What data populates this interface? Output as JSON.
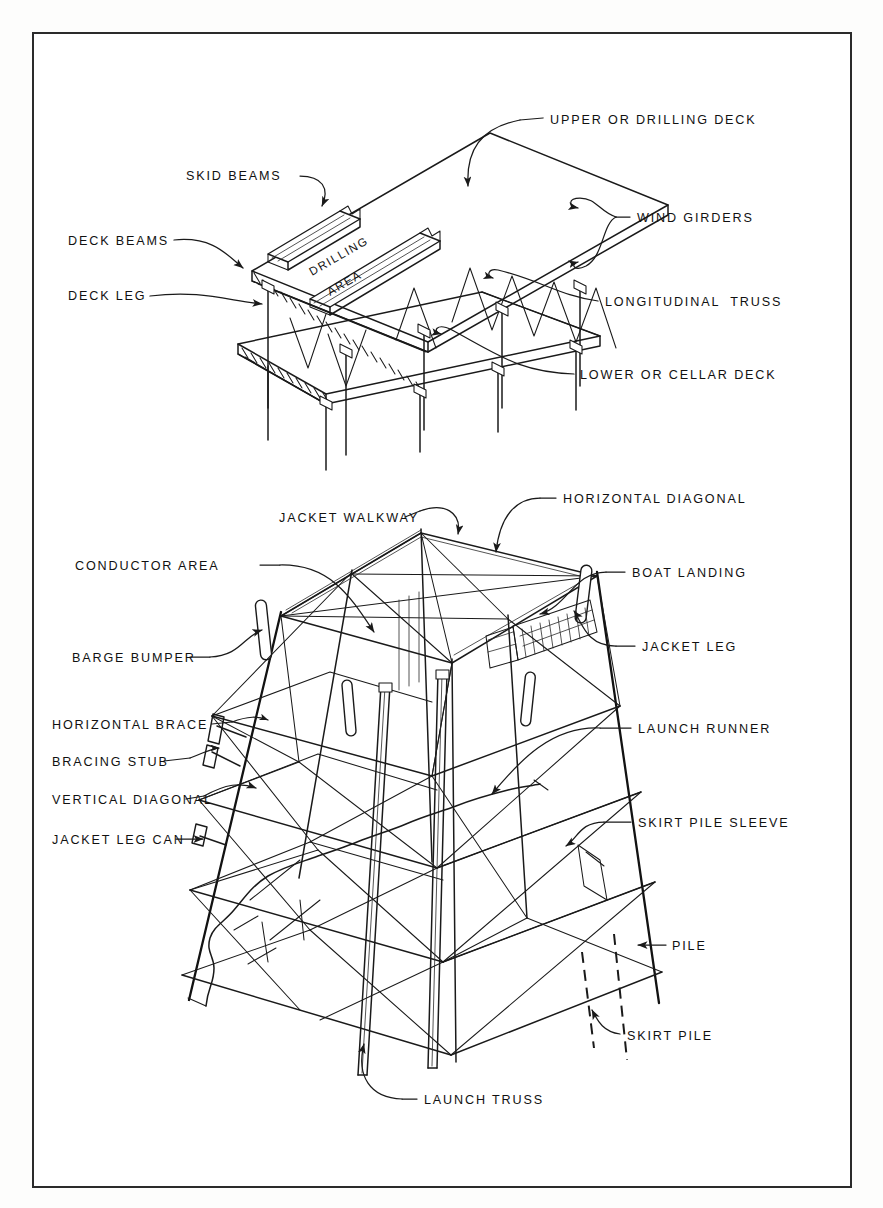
{
  "figure": {
    "domain": "engineering-diagram",
    "line_color": "#1a1a1a",
    "background_color": "#ffffff",
    "frame_color": "#2b2b2b"
  },
  "upper_diagram": {
    "name": "deck-structure",
    "inline_text": {
      "drilling_area_line1": "DRILLING",
      "drilling_area_line2": "AREA"
    },
    "labels": [
      {
        "id": "skid-beams",
        "text": "SKID BEAMS",
        "x": 186,
        "y": 180,
        "anchor": "start"
      },
      {
        "id": "deck-beams",
        "text": "DECK BEAMS",
        "x": 68,
        "y": 245,
        "anchor": "start"
      },
      {
        "id": "deck-leg",
        "text": "DECK LEG",
        "x": 68,
        "y": 300,
        "anchor": "start"
      },
      {
        "id": "upper-drilling-deck",
        "text": "UPPER OR DRILLING DECK",
        "x": 550,
        "y": 124,
        "anchor": "start"
      },
      {
        "id": "wind-girders",
        "text": "WIND GIRDERS",
        "x": 637,
        "y": 222,
        "anchor": "start"
      },
      {
        "id": "longitudinal-truss",
        "text": "LONGITUDINAL  TRUSS",
        "x": 605,
        "y": 306,
        "anchor": "start"
      },
      {
        "id": "lower-cellar-deck",
        "text": "LOWER OR CELLAR DECK",
        "x": 580,
        "y": 379,
        "anchor": "start"
      }
    ]
  },
  "lower_diagram": {
    "name": "jacket-structure",
    "labels": [
      {
        "id": "jacket-walkway",
        "text": "JACKET WALKWAY",
        "x": 279,
        "y": 522,
        "anchor": "start"
      },
      {
        "id": "horizontal-diagonal",
        "text": "HORIZONTAL DIAGONAL",
        "x": 563,
        "y": 503,
        "anchor": "start"
      },
      {
        "id": "conductor-area",
        "text": "CONDUCTOR AREA",
        "x": 75,
        "y": 570,
        "anchor": "start"
      },
      {
        "id": "boat-landing",
        "text": "BOAT LANDING",
        "x": 632,
        "y": 577,
        "anchor": "start"
      },
      {
        "id": "barge-bumper",
        "text": "BARGE BUMPER",
        "x": 72,
        "y": 662,
        "anchor": "start"
      },
      {
        "id": "jacket-leg",
        "text": "JACKET LEG",
        "x": 642,
        "y": 651,
        "anchor": "start"
      },
      {
        "id": "horizontal-brace",
        "text": "HORIZONTAL BRACE",
        "x": 52,
        "y": 729,
        "anchor": "start"
      },
      {
        "id": "bracing-stub",
        "text": "BRACING STUB",
        "x": 52,
        "y": 766,
        "anchor": "start"
      },
      {
        "id": "launch-runner",
        "text": "LAUNCH RUNNER",
        "x": 638,
        "y": 733,
        "anchor": "start"
      },
      {
        "id": "vertical-diagonal",
        "text": "VERTICAL DIAGONAL",
        "x": 52,
        "y": 804,
        "anchor": "start"
      },
      {
        "id": "skirt-pile-sleeve",
        "text": "SKIRT PILE SLEEVE",
        "x": 638,
        "y": 827,
        "anchor": "start"
      },
      {
        "id": "jacket-leg-can",
        "text": "JACKET LEG CAN",
        "x": 52,
        "y": 844,
        "anchor": "start"
      },
      {
        "id": "pile",
        "text": "PILE",
        "x": 672,
        "y": 950,
        "anchor": "start"
      },
      {
        "id": "skirt-pile",
        "text": "SKIRT PILE",
        "x": 627,
        "y": 1040,
        "anchor": "start"
      },
      {
        "id": "launch-truss",
        "text": "LAUNCH TRUSS",
        "x": 424,
        "y": 1104,
        "anchor": "start"
      }
    ]
  }
}
